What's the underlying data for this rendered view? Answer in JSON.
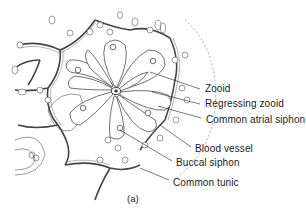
{
  "figure": {
    "caption": "(a)",
    "labels": [
      {
        "id": "zooid",
        "text": "Zooid",
        "x": 205,
        "y": 83,
        "pointer_from": [
          200,
          89
        ],
        "pointer_to": [
          150,
          72
        ]
      },
      {
        "id": "regressing-zooid",
        "text": "Regressing zooid",
        "x": 205,
        "y": 98,
        "pointer_from": [
          200,
          104
        ],
        "pointer_to": [
          152,
          92
        ]
      },
      {
        "id": "common-atrial-siphon",
        "text": "Common atrial siphon",
        "x": 206,
        "y": 114,
        "pointer_from": [
          201,
          118
        ],
        "pointer_to": [
          158,
          106
        ]
      },
      {
        "id": "blood-vessel",
        "text": "Blood vessel",
        "x": 195,
        "y": 143,
        "pointer_from": [
          191,
          147
        ],
        "pointer_to": [
          160,
          125
        ]
      },
      {
        "id": "buccal-siphon",
        "text": "Buccal siphon",
        "x": 176,
        "y": 157,
        "pointer_from": [
          172,
          161
        ],
        "pointer_to": [
          120,
          130
        ]
      },
      {
        "id": "common-tunic",
        "text": "Common tunic",
        "x": 173,
        "y": 177,
        "pointer_from": [
          169,
          180
        ],
        "pointer_to": [
          140,
          168
        ]
      }
    ]
  }
}
